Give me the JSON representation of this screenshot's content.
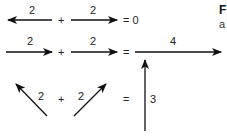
{
  "diagram": {
    "row1": {
      "vector_a_label": "2",
      "plus": "+",
      "vector_b_label": "2",
      "result": "= 0"
    },
    "row2": {
      "vector_a_label": "2",
      "plus": "+",
      "vector_b_label": "2",
      "equals": "=",
      "result_label": "4"
    },
    "row3": {
      "vector_a_label": "2",
      "plus": "+",
      "vector_b_label": "2",
      "equals": "=",
      "result_label": "3"
    },
    "side_text": {
      "title_fragment": "F",
      "sub_fragment": "a"
    }
  },
  "colors": {
    "ink": "#111111",
    "background": "#ffffff"
  }
}
